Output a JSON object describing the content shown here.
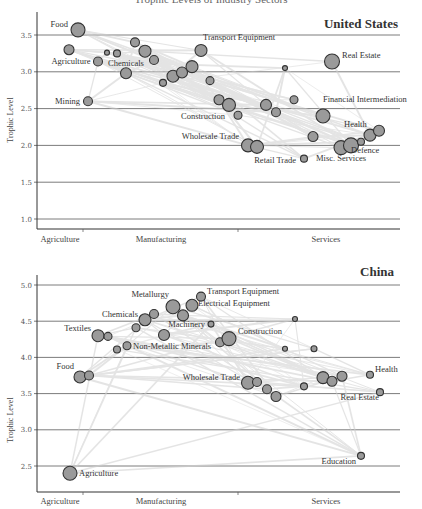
{
  "chart_data": [
    {
      "type": "scatter",
      "title": "United States",
      "xlabel": "",
      "ylabel": "Trophic Level",
      "ylim": [
        0.85,
        3.75
      ],
      "yticks": [
        "1.0",
        "1.5",
        "2.0",
        "2.5",
        "3.0",
        "3.5"
      ],
      "xticks": [
        "Agriculture",
        "Manufacturing",
        "Services"
      ],
      "grid": true,
      "nodes": [
        {
          "x": 78,
          "y": 3.57,
          "r": 7,
          "label": "Food"
        },
        {
          "x": 69,
          "y": 3.3,
          "r": 5,
          "label": "Agriculture"
        },
        {
          "x": 107,
          "y": 3.26,
          "r": 2.5,
          "label": ""
        },
        {
          "x": 117,
          "y": 3.25,
          "r": 3.5,
          "label": ""
        },
        {
          "x": 98,
          "y": 3.14,
          "r": 4.5,
          "label": ""
        },
        {
          "x": 135,
          "y": 3.4,
          "r": 4.5,
          "label": ""
        },
        {
          "x": 145,
          "y": 3.28,
          "r": 6,
          "label": ""
        },
        {
          "x": 154,
          "y": 3.16,
          "r": 4.5,
          "label": "Chemicals"
        },
        {
          "x": 126,
          "y": 2.98,
          "r": 5.5,
          "label": ""
        },
        {
          "x": 163,
          "y": 2.85,
          "r": 3.5,
          "label": ""
        },
        {
          "x": 173,
          "y": 2.94,
          "r": 6,
          "label": ""
        },
        {
          "x": 182,
          "y": 2.99,
          "r": 5.5,
          "label": ""
        },
        {
          "x": 192,
          "y": 3.07,
          "r": 6,
          "label": ""
        },
        {
          "x": 201,
          "y": 3.29,
          "r": 6,
          "label": "Transport Equipment"
        },
        {
          "x": 210,
          "y": 2.88,
          "r": 4,
          "label": ""
        },
        {
          "x": 88,
          "y": 2.6,
          "r": 4.5,
          "label": "Mining"
        },
        {
          "x": 219,
          "y": 2.62,
          "r": 5,
          "label": ""
        },
        {
          "x": 229,
          "y": 2.55,
          "r": 6.5,
          "label": ""
        },
        {
          "x": 238,
          "y": 2.41,
          "r": 4,
          "label": "Construction"
        },
        {
          "x": 266,
          "y": 2.55,
          "r": 5.5,
          "label": ""
        },
        {
          "x": 276,
          "y": 2.45,
          "r": 4.5,
          "label": ""
        },
        {
          "x": 285,
          "y": 3.05,
          "r": 2.5,
          "label": ""
        },
        {
          "x": 294,
          "y": 2.62,
          "r": 4,
          "label": ""
        },
        {
          "x": 332,
          "y": 3.14,
          "r": 7.5,
          "label": "Real Estate"
        },
        {
          "x": 323,
          "y": 2.4,
          "r": 7,
          "label": "Financial Intermediation"
        },
        {
          "x": 313,
          "y": 2.12,
          "r": 5,
          "label": ""
        },
        {
          "x": 248,
          "y": 2.0,
          "r": 6.5,
          "label": "Wholesale Trade"
        },
        {
          "x": 257,
          "y": 1.98,
          "r": 6.5,
          "label": ""
        },
        {
          "x": 304,
          "y": 1.82,
          "r": 3.5,
          "label": "Retail Trade"
        },
        {
          "x": 341,
          "y": 1.97,
          "r": 7,
          "label": "Misc. Services"
        },
        {
          "x": 351,
          "y": 2.0,
          "r": 7.5,
          "label": ""
        },
        {
          "x": 361,
          "y": 2.05,
          "r": 3.5,
          "label": "Defence"
        },
        {
          "x": 370,
          "y": 2.14,
          "r": 6,
          "label": "Health"
        },
        {
          "x": 379,
          "y": 2.2,
          "r": 5.5,
          "label": ""
        }
      ]
    },
    {
      "type": "scatter",
      "title": "China",
      "xlabel": "",
      "ylabel": "Trophic Level",
      "ylim": [
        2.15,
        5.1
      ],
      "yticks": [
        "2.5",
        "3.0",
        "3.5",
        "4.0",
        "4.5",
        "5.0"
      ],
      "xticks": [
        "Agriculture",
        "Manufacturing",
        "Services"
      ],
      "grid": true,
      "nodes": [
        {
          "x": 70,
          "y": 2.4,
          "r": 7,
          "label": "Agriculture"
        },
        {
          "x": 80,
          "y": 3.73,
          "r": 6,
          "label": "Food"
        },
        {
          "x": 89,
          "y": 3.75,
          "r": 4.5,
          "label": ""
        },
        {
          "x": 98,
          "y": 4.3,
          "r": 6,
          "label": "Textiles"
        },
        {
          "x": 108,
          "y": 4.29,
          "r": 4,
          "label": ""
        },
        {
          "x": 117,
          "y": 4.11,
          "r": 3.5,
          "label": ""
        },
        {
          "x": 127,
          "y": 4.16,
          "r": 4,
          "label": "Non-Metallic Minerals"
        },
        {
          "x": 136,
          "y": 4.41,
          "r": 4,
          "label": ""
        },
        {
          "x": 145,
          "y": 4.52,
          "r": 6,
          "label": "Chemicals"
        },
        {
          "x": 154,
          "y": 4.6,
          "r": 4.5,
          "label": ""
        },
        {
          "x": 164,
          "y": 4.31,
          "r": 5.5,
          "label": ""
        },
        {
          "x": 173,
          "y": 4.7,
          "r": 7,
          "label": "Metallurgy"
        },
        {
          "x": 183,
          "y": 4.58,
          "r": 5.5,
          "label": ""
        },
        {
          "x": 192,
          "y": 4.72,
          "r": 6,
          "label": "Electrical Equipment"
        },
        {
          "x": 201,
          "y": 4.84,
          "r": 4.5,
          "label": "Transport Equipment"
        },
        {
          "x": 211,
          "y": 4.46,
          "r": 3,
          "label": "Machinery"
        },
        {
          "x": 220,
          "y": 4.21,
          "r": 4.5,
          "label": ""
        },
        {
          "x": 229,
          "y": 4.26,
          "r": 7,
          "label": "Construction"
        },
        {
          "x": 295,
          "y": 4.53,
          "r": 2.5,
          "label": ""
        },
        {
          "x": 285,
          "y": 4.12,
          "r": 2.5,
          "label": ""
        },
        {
          "x": 314,
          "y": 4.12,
          "r": 3,
          "label": ""
        },
        {
          "x": 248,
          "y": 3.65,
          "r": 6.5,
          "label": "Wholesale Trade"
        },
        {
          "x": 257,
          "y": 3.66,
          "r": 4.5,
          "label": ""
        },
        {
          "x": 267,
          "y": 3.56,
          "r": 4.5,
          "label": ""
        },
        {
          "x": 276,
          "y": 3.46,
          "r": 5,
          "label": ""
        },
        {
          "x": 304,
          "y": 3.6,
          "r": 3.5,
          "label": ""
        },
        {
          "x": 323,
          "y": 3.72,
          "r": 6,
          "label": ""
        },
        {
          "x": 332,
          "y": 3.67,
          "r": 5,
          "label": ""
        },
        {
          "x": 342,
          "y": 3.74,
          "r": 5,
          "label": ""
        },
        {
          "x": 370,
          "y": 3.76,
          "r": 3.5,
          "label": "Health"
        },
        {
          "x": 380,
          "y": 3.52,
          "r": 3.5,
          "label": "Real Estate"
        },
        {
          "x": 361,
          "y": 2.64,
          "r": 3.5,
          "label": "Education"
        }
      ]
    }
  ],
  "page": {
    "top_title": "Trophic Levels of Industry Sectors"
  }
}
